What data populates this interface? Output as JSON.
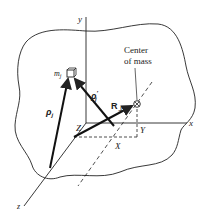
{
  "diagram": {
    "type": "physics-vector-diagram",
    "axes": {
      "x_label": "x",
      "y_label": "y",
      "z_label": "z"
    },
    "particle": {
      "label": "m",
      "subscript": "j"
    },
    "vectors": {
      "rho": {
        "label": "ρ",
        "subscript": "j"
      },
      "rho_prime": {
        "label": "ρ",
        "prime": "′",
        "subscript": "j"
      },
      "R_perp": {
        "label": "R",
        "subscript": "⊥"
      }
    },
    "center_of_mass": {
      "line1": "Center",
      "line2": "of mass",
      "symbol": "⊗"
    },
    "coordinates": {
      "X": "X",
      "Y": "Y",
      "Z": "Z"
    },
    "colors": {
      "ink": "#222222",
      "background": "#ffffff"
    }
  }
}
